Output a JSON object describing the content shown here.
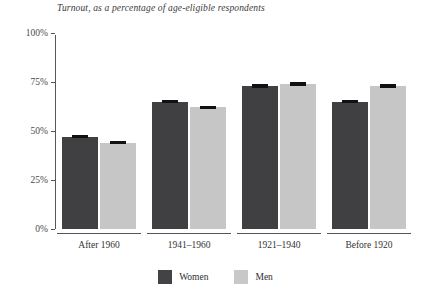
{
  "chart_data": {
    "type": "bar",
    "title": "Turnout, as a percentage of age-eligible respondents",
    "xlabel": "",
    "ylabel": "",
    "ylim": [
      0,
      100
    ],
    "yticks": [
      0,
      25,
      50,
      75,
      100
    ],
    "ytick_labels": [
      "0%",
      "25%",
      "50%",
      "75%",
      "100%"
    ],
    "grid": false,
    "legend_position": "bottom-center",
    "categories": [
      "After 1960",
      "1941–1960",
      "1921–1940",
      "Before 1920"
    ],
    "series": [
      {
        "name": "Women",
        "color": "#404042",
        "values": [
          47,
          65,
          73,
          65
        ],
        "errors": [
          1.5,
          1.5,
          1.5,
          1.5
        ]
      },
      {
        "name": "Men",
        "color": "#c6c6c6",
        "values": [
          44,
          62,
          74,
          73
        ],
        "errors": [
          1.5,
          1.5,
          1.5,
          1.5
        ]
      }
    ]
  },
  "legend": {
    "items": [
      {
        "label": "Women",
        "color": "#434345"
      },
      {
        "label": "Men",
        "color": "#c8c8c8"
      }
    ]
  }
}
